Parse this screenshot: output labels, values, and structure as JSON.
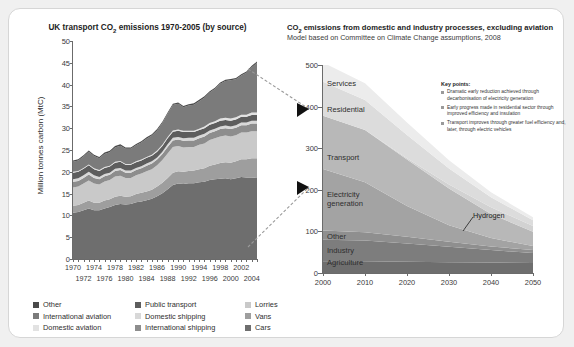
{
  "left": {
    "title_pre": "UK transport CO",
    "title_sub": "2",
    "title_post": " emissions 1970-2005 (by source)",
    "ylabel": "Million tonnes carbon (MtC)",
    "legend": [
      [
        {
          "label": "Other",
          "color": "#4a4a4a"
        },
        {
          "label": "Public transport",
          "color": "#5d5d5d"
        },
        {
          "label": "Lorries",
          "color": "#c9c9c9"
        }
      ],
      [
        {
          "label": "International aviation",
          "color": "#7b7b7b"
        },
        {
          "label": "Domestic shipping",
          "color": "#d8d8d8"
        },
        {
          "label": "Vans",
          "color": "#9e9e9e"
        }
      ],
      [
        {
          "label": "Domestic aviation",
          "color": "#e2e2e2"
        },
        {
          "label": "International shipping",
          "color": "#8d8d8d"
        },
        {
          "label": "Cars",
          "color": "#6e6e6e"
        }
      ]
    ]
  },
  "right": {
    "title_pre": "CO",
    "title_sub": "2",
    "title_post": " emissions from domestic and industry processes, excluding aviation",
    "subtitle": "Model based on Committee on Climate Change assumptions, 2008",
    "keypoints_title": "Key points:",
    "keypoints": [
      "Dramatic early reduction achieved through decarbonisation of electricity generation",
      "Early progress made in residential sector through improved efficiency and insulation",
      "Transport improves through greater fuel efficiency and, later, through electric vehicles"
    ],
    "band_labels": [
      "Services",
      "Residential",
      "Transport",
      "Electricity generation",
      "Other",
      "Industry",
      "Agriculture"
    ],
    "annotation": "Hydrogen"
  },
  "chart_data": [
    {
      "type": "area",
      "title": "UK transport CO2 emissions 1970-2005 (by source)",
      "xlabel": "",
      "ylabel": "Million tonnes carbon (MtC)",
      "xlim": [
        1970,
        2005
      ],
      "ylim": [
        0,
        50
      ],
      "yticks": [
        0,
        5,
        10,
        15,
        20,
        25,
        30,
        35,
        40,
        45,
        50
      ],
      "xticks_row1": [
        1970,
        1974,
        1978,
        1982,
        1986,
        1990,
        1994,
        1998,
        2002
      ],
      "xticks_row2": [
        1972,
        1976,
        1980,
        1984,
        1988,
        1992,
        1996,
        2000,
        2004
      ],
      "grid": false,
      "legend_position": "below",
      "x": [
        1970,
        1971,
        1972,
        1973,
        1974,
        1975,
        1976,
        1977,
        1978,
        1979,
        1980,
        1981,
        1982,
        1983,
        1984,
        1985,
        1986,
        1987,
        1988,
        1989,
        1990,
        1991,
        1992,
        1993,
        1994,
        1995,
        1996,
        1997,
        1998,
        1999,
        2000,
        2001,
        2002,
        2003,
        2004,
        2005
      ],
      "series": [
        {
          "name": "Cars",
          "color": "#6e6e6e",
          "values": [
            10.6,
            10.8,
            11.2,
            11.6,
            11.2,
            11.2,
            11.6,
            11.9,
            12.4,
            12.6,
            12.5,
            12.6,
            13.0,
            13.2,
            13.5,
            13.8,
            14.4,
            15.1,
            16.0,
            17.0,
            17.3,
            17.2,
            17.4,
            17.4,
            17.6,
            17.7,
            18.1,
            18.3,
            18.4,
            18.5,
            18.3,
            18.5,
            18.8,
            18.7,
            18.7,
            18.6
          ]
        },
        {
          "name": "Vans",
          "color": "#9e9e9e",
          "values": [
            1.6,
            1.6,
            1.7,
            1.8,
            1.7,
            1.7,
            1.8,
            1.8,
            1.9,
            1.9,
            1.8,
            1.8,
            1.9,
            2.0,
            2.0,
            2.1,
            2.2,
            2.4,
            2.6,
            2.8,
            2.8,
            2.8,
            2.8,
            2.9,
            3.0,
            3.1,
            3.3,
            3.4,
            3.6,
            3.7,
            3.8,
            3.9,
            4.1,
            4.2,
            4.4,
            4.5
          ]
        },
        {
          "name": "Lorries",
          "color": "#c9c9c9",
          "values": [
            4.2,
            4.2,
            4.4,
            4.6,
            4.4,
            4.2,
            4.4,
            4.4,
            4.6,
            4.6,
            4.3,
            4.2,
            4.3,
            4.4,
            4.6,
            4.7,
            4.9,
            5.2,
            5.6,
            5.9,
            5.8,
            5.6,
            5.5,
            5.4,
            5.6,
            5.7,
            5.9,
            6.0,
            6.1,
            6.1,
            6.0,
            6.0,
            6.1,
            6.1,
            6.2,
            6.2
          ]
        },
        {
          "name": "International shipping",
          "color": "#8d8d8d",
          "values": [
            1.3,
            1.3,
            1.3,
            1.4,
            1.3,
            1.2,
            1.2,
            1.2,
            1.3,
            1.3,
            1.2,
            1.2,
            1.2,
            1.2,
            1.3,
            1.3,
            1.3,
            1.4,
            1.5,
            1.5,
            1.5,
            1.5,
            1.5,
            1.5,
            1.5,
            1.6,
            1.6,
            1.6,
            1.7,
            1.7,
            1.7,
            1.7,
            1.7,
            1.7,
            1.8,
            1.8
          ]
        },
        {
          "name": "Domestic shipping",
          "color": "#d8d8d8",
          "values": [
            0.6,
            0.6,
            0.6,
            0.6,
            0.6,
            0.5,
            0.5,
            0.5,
            0.5,
            0.5,
            0.5,
            0.5,
            0.5,
            0.5,
            0.5,
            0.5,
            0.5,
            0.5,
            0.6,
            0.6,
            0.6,
            0.6,
            0.6,
            0.6,
            0.6,
            0.6,
            0.6,
            0.6,
            0.6,
            0.6,
            0.6,
            0.6,
            0.6,
            0.6,
            0.6,
            0.6
          ]
        },
        {
          "name": "Public transport",
          "color": "#5d5d5d",
          "values": [
            1.5,
            1.5,
            1.5,
            1.5,
            1.4,
            1.4,
            1.4,
            1.4,
            1.4,
            1.4,
            1.3,
            1.3,
            1.3,
            1.3,
            1.3,
            1.3,
            1.3,
            1.3,
            1.4,
            1.4,
            1.4,
            1.4,
            1.3,
            1.3,
            1.3,
            1.3,
            1.3,
            1.3,
            1.3,
            1.3,
            1.3,
            1.3,
            1.3,
            1.3,
            1.3,
            1.3
          ]
        },
        {
          "name": "Domestic aviation",
          "color": "#e2e2e2",
          "values": [
            0.2,
            0.2,
            0.2,
            0.2,
            0.2,
            0.2,
            0.2,
            0.2,
            0.2,
            0.2,
            0.2,
            0.2,
            0.2,
            0.2,
            0.2,
            0.2,
            0.3,
            0.3,
            0.3,
            0.3,
            0.3,
            0.3,
            0.3,
            0.3,
            0.3,
            0.4,
            0.4,
            0.4,
            0.5,
            0.5,
            0.5,
            0.5,
            0.5,
            0.5,
            0.6,
            0.6
          ]
        },
        {
          "name": "International aviation",
          "color": "#7b7b7b",
          "values": [
            2.3,
            2.4,
            2.6,
            2.9,
            2.8,
            2.7,
            3.0,
            3.1,
            3.3,
            3.5,
            3.5,
            3.5,
            3.7,
            3.9,
            4.2,
            4.4,
            4.6,
            5.0,
            5.3,
            5.8,
            5.9,
            5.4,
            5.8,
            6.0,
            6.3,
            6.6,
            7.0,
            7.4,
            8.0,
            8.4,
            8.8,
            8.7,
            9.0,
            9.6,
            10.4,
            11.4
          ]
        },
        {
          "name": "Other",
          "color": "#4a4a4a",
          "values": [
            0.3,
            0.3,
            0.3,
            0.3,
            0.3,
            0.3,
            0.3,
            0.3,
            0.3,
            0.3,
            0.3,
            0.3,
            0.3,
            0.3,
            0.3,
            0.3,
            0.3,
            0.3,
            0.3,
            0.3,
            0.3,
            0.3,
            0.3,
            0.3,
            0.3,
            0.3,
            0.3,
            0.3,
            0.3,
            0.3,
            0.3,
            0.3,
            0.3,
            0.3,
            0.3,
            0.3
          ]
        }
      ]
    },
    {
      "type": "area",
      "title": "CO2 emissions from domestic and industry processes, excluding aviation",
      "subtitle": "Model based on Committee on Climate Change assumptions, 2008",
      "xlabel": "",
      "ylabel": "",
      "xlim": [
        2000,
        2050
      ],
      "ylim": [
        0,
        500
      ],
      "yticks": [
        0,
        100,
        200,
        300,
        400,
        500
      ],
      "xticks": [
        2000,
        2010,
        2020,
        2030,
        2040,
        2050
      ],
      "grid": false,
      "legend_position": "inline-labels",
      "x": [
        2000,
        2010,
        2020,
        2030,
        2040,
        2050
      ],
      "series": [
        {
          "name": "Agriculture",
          "color": "#6e6e6e",
          "values": [
            28,
            28,
            27,
            26,
            25,
            24
          ]
        },
        {
          "name": "Industry",
          "color": "#7d7d7d",
          "values": [
            52,
            50,
            44,
            37,
            30,
            24
          ]
        },
        {
          "name": "Other",
          "color": "#8f8f8f",
          "values": [
            22,
            20,
            16,
            12,
            9,
            7
          ]
        },
        {
          "name": "Electricity generation",
          "color": "#a3a3a3",
          "values": [
            148,
            120,
            74,
            40,
            20,
            10
          ]
        },
        {
          "name": "Transport",
          "color": "#b8b8b8",
          "values": [
            128,
            126,
            112,
            88,
            58,
            34
          ]
        },
        {
          "name": "Hydrogen",
          "color": "#d2d2d2",
          "values": [
            0,
            0,
            3,
            10,
            16,
            14
          ]
        },
        {
          "name": "Residential",
          "color": "#dcdcdc",
          "values": [
            82,
            72,
            56,
            38,
            24,
            14
          ]
        },
        {
          "name": "Services",
          "color": "#ececec",
          "values": [
            46,
            40,
            30,
            20,
            12,
            7
          ]
        }
      ],
      "annotations": [
        {
          "text": "Hydrogen",
          "x": 2040,
          "y": 120
        }
      ]
    }
  ]
}
